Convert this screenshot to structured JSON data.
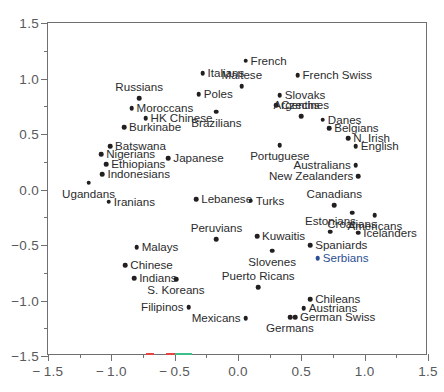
{
  "chart_data": {
    "type": "scatter",
    "title": "",
    "xlabel": "",
    "ylabel": "",
    "xlim": [
      -1.5,
      1.5
    ],
    "ylim": [
      -1.5,
      1.5
    ],
    "xticks": [
      "-1.5",
      "-1.0",
      "-0.5",
      "0.0",
      "0.5",
      "1.0",
      "1.5"
    ],
    "xtick_values": [
      -1.5,
      -1.0,
      -0.5,
      0.0,
      0.5,
      1.0,
      1.5
    ],
    "yticks": [
      "1.5",
      "1.0",
      "0.5",
      "0.0",
      "-0.5",
      "-1.0",
      "-1.5"
    ],
    "ytick_values": [
      1.5,
      1.0,
      0.5,
      0.0,
      -0.5,
      -1.0,
      -1.5
    ],
    "minor_tick_step": 0.25,
    "grid": false,
    "legend": null,
    "marker_color": "#231f20",
    "accent_color": "#2b4f93",
    "axis_color": "#6f7072",
    "points": [
      {
        "label": "French",
        "x": 0.06,
        "y": 1.16,
        "pos": "right"
      },
      {
        "label": "Italians",
        "x": -0.28,
        "y": 1.05,
        "pos": "right"
      },
      {
        "label": "French Swiss",
        "x": 0.47,
        "y": 1.03,
        "pos": "right"
      },
      {
        "label": "Maltese",
        "x": 0.03,
        "y": 0.93,
        "pos": "above"
      },
      {
        "label": "Poles",
        "x": -0.31,
        "y": 0.86,
        "pos": "right"
      },
      {
        "label": "Slovaks",
        "x": 0.33,
        "y": 0.85,
        "pos": "right"
      },
      {
        "label": "Russians",
        "x": -0.78,
        "y": 0.82,
        "pos": "above"
      },
      {
        "label": "Czechs",
        "x": 0.3,
        "y": 0.76,
        "pos": "right"
      },
      {
        "label": "Moroccans",
        "x": -0.84,
        "y": 0.73,
        "pos": "right"
      },
      {
        "label": "Brazilians",
        "x": -0.17,
        "y": 0.7,
        "pos": "below"
      },
      {
        "label": "Argentines",
        "x": 0.5,
        "y": 0.66,
        "pos": "above"
      },
      {
        "label": "HK Chinese",
        "x": -0.73,
        "y": 0.64,
        "pos": "right"
      },
      {
        "label": "Danes",
        "x": 0.67,
        "y": 0.63,
        "pos": "right"
      },
      {
        "label": "Burkinabe",
        "x": -0.9,
        "y": 0.56,
        "pos": "right"
      },
      {
        "label": "Belgians",
        "x": 0.72,
        "y": 0.55,
        "pos": "right"
      },
      {
        "label": "N. Irish",
        "x": 0.87,
        "y": 0.46,
        "pos": "right"
      },
      {
        "label": "Batswana",
        "x": -1.01,
        "y": 0.39,
        "pos": "right"
      },
      {
        "label": "Portuguese",
        "x": 0.33,
        "y": 0.4,
        "pos": "below"
      },
      {
        "label": "English",
        "x": 0.93,
        "y": 0.39,
        "pos": "right"
      },
      {
        "label": "Nigerians",
        "x": -1.08,
        "y": 0.32,
        "pos": "right"
      },
      {
        "label": "Japanese",
        "x": -0.55,
        "y": 0.28,
        "pos": "right"
      },
      {
        "label": "Ethiopians",
        "x": -1.04,
        "y": 0.23,
        "pos": "right"
      },
      {
        "label": "Australians",
        "x": 0.93,
        "y": 0.22,
        "pos": "left"
      },
      {
        "label": "Indonesians",
        "x": -1.07,
        "y": 0.14,
        "pos": "right"
      },
      {
        "label": "New Zealanders",
        "x": 0.95,
        "y": 0.12,
        "pos": "left"
      },
      {
        "label": "Ugandans",
        "x": -1.18,
        "y": 0.06,
        "pos": "below"
      },
      {
        "label": "Canadians",
        "x": 0.76,
        "y": -0.14,
        "pos": "above"
      },
      {
        "label": "Lebanese",
        "x": -0.33,
        "y": -0.09,
        "pos": "right"
      },
      {
        "label": "Turks",
        "x": 0.1,
        "y": -0.1,
        "pos": "right"
      },
      {
        "label": "Iranians",
        "x": -1.02,
        "y": -0.11,
        "pos": "right"
      },
      {
        "label": "Croatians",
        "x": 0.9,
        "y": -0.21,
        "pos": "below"
      },
      {
        "label": "Americans",
        "x": 1.08,
        "y": -0.23,
        "pos": "below"
      },
      {
        "label": "Estonians",
        "x": 0.73,
        "y": -0.38,
        "pos": "above"
      },
      {
        "label": "Icelanders",
        "x": 0.95,
        "y": -0.39,
        "pos": "right"
      },
      {
        "label": "Peruvians",
        "x": -0.17,
        "y": -0.45,
        "pos": "above"
      },
      {
        "label": "Kuwaitis",
        "x": 0.15,
        "y": -0.42,
        "pos": "right"
      },
      {
        "label": "Malays",
        "x": -0.8,
        "y": -0.52,
        "pos": "right"
      },
      {
        "label": "Spaniards",
        "x": 0.57,
        "y": -0.5,
        "pos": "right"
      },
      {
        "label": "Slovenes",
        "x": 0.27,
        "y": -0.55,
        "pos": "below"
      },
      {
        "label": "Serbians",
        "x": 0.63,
        "y": -0.62,
        "pos": "right",
        "color": "#2b4f93"
      },
      {
        "label": "Chinese",
        "x": -0.89,
        "y": -0.68,
        "pos": "right"
      },
      {
        "label": "Indians",
        "x": -0.82,
        "y": -0.8,
        "pos": "right"
      },
      {
        "label": "S. Koreans",
        "x": -0.49,
        "y": -0.81,
        "pos": "below"
      },
      {
        "label": "Puerto Ricans",
        "x": 0.16,
        "y": -0.88,
        "pos": "above"
      },
      {
        "label": "Chileans",
        "x": 0.57,
        "y": -0.99,
        "pos": "right"
      },
      {
        "label": "Filipinos",
        "x": -0.39,
        "y": -1.06,
        "pos": "left"
      },
      {
        "label": "Austrians",
        "x": 0.52,
        "y": -1.07,
        "pos": "right"
      },
      {
        "label": "German Swiss",
        "x": 0.45,
        "y": -1.15,
        "pos": "right"
      },
      {
        "label": "Germans",
        "x": 0.41,
        "y": -1.15,
        "pos": "below"
      },
      {
        "label": "Mexicans",
        "x": 0.06,
        "y": -1.16,
        "pos": "left"
      }
    ],
    "axis_specks": [
      {
        "x_start": -0.73,
        "x_end": -0.66,
        "color": "#e8443f"
      },
      {
        "x_start": -0.57,
        "x_end": -0.5,
        "color": "#e8443f"
      },
      {
        "x_start": -0.5,
        "x_end": -0.36,
        "color": "#3cc08a"
      }
    ]
  }
}
